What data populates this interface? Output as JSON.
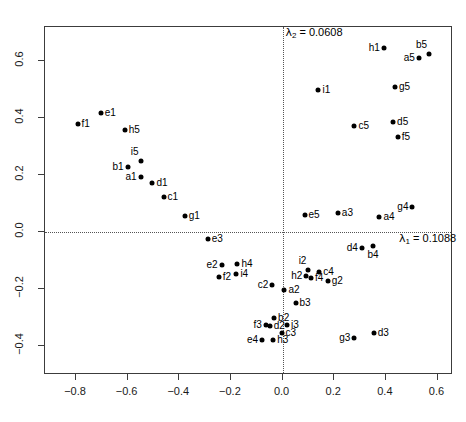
{
  "chart_data": {
    "type": "scatter",
    "title": "",
    "xlabel": "",
    "ylabel": "",
    "xlim": [
      -0.92,
      0.66
    ],
    "ylim": [
      -0.5,
      0.72
    ],
    "xticks": [
      "-0.8",
      "-0.6",
      "-0.4",
      "-0.2",
      "0.0",
      "0.2",
      "0.4",
      "0.6"
    ],
    "xtick_values": [
      -0.8,
      -0.6,
      -0.4,
      -0.2,
      0.0,
      0.2,
      0.4,
      0.6
    ],
    "yticks": [
      "0.6",
      "0.4",
      "0.2",
      "0.0",
      "-0.2",
      "-0.4"
    ],
    "ytick_values": [
      0.6,
      0.4,
      0.2,
      0.0,
      -0.2,
      -0.4
    ],
    "grid": false,
    "legend": null,
    "reference_lines": [
      {
        "orientation": "horizontal",
        "value": 0.0,
        "style": "dotted"
      },
      {
        "orientation": "vertical",
        "value": 0.0,
        "style": "dotted"
      }
    ],
    "annotations": [
      {
        "name": "lambda2-annotation",
        "text_lambda": "λ",
        "text_sub": "2",
        "text_rest": "= 0.0608",
        "x": 0.015,
        "y": 0.695,
        "align": "left"
      },
      {
        "name": "lambda1-annotation",
        "text_lambda": "λ",
        "text_sub": "1",
        "text_rest": "= 0.1088",
        "x": 0.455,
        "y": -0.026,
        "align": "left"
      }
    ],
    "points": [
      {
        "label": "f1",
        "x": -0.79,
        "y": 0.375,
        "lpos": "right"
      },
      {
        "label": "e1",
        "x": -0.7,
        "y": 0.414,
        "lpos": "right"
      },
      {
        "label": "h5",
        "x": -0.607,
        "y": 0.357,
        "lpos": "right"
      },
      {
        "label": "i5",
        "x": -0.546,
        "y": 0.246,
        "lpos": "left-up"
      },
      {
        "label": "b1",
        "x": -0.596,
        "y": 0.225,
        "lpos": "left"
      },
      {
        "label": "a1",
        "x": -0.546,
        "y": 0.189,
        "lpos": "left"
      },
      {
        "label": "d1",
        "x": -0.5,
        "y": 0.171,
        "lpos": "right"
      },
      {
        "label": "c1",
        "x": -0.457,
        "y": 0.121,
        "lpos": "right"
      },
      {
        "label": "g1",
        "x": -0.375,
        "y": 0.054,
        "lpos": "right"
      },
      {
        "label": "e3",
        "x": -0.286,
        "y": -0.027,
        "lpos": "right"
      },
      {
        "label": "e2",
        "x": -0.232,
        "y": -0.118,
        "lpos": "left"
      },
      {
        "label": "f2",
        "x": -0.243,
        "y": -0.161,
        "lpos": "right"
      },
      {
        "label": "h4",
        "x": -0.171,
        "y": -0.114,
        "lpos": "right"
      },
      {
        "label": "i4",
        "x": -0.175,
        "y": -0.15,
        "lpos": "right"
      },
      {
        "label": "c2",
        "x": -0.036,
        "y": -0.189,
        "lpos": "left"
      },
      {
        "label": "a2",
        "x": 0.011,
        "y": -0.207,
        "lpos": "right"
      },
      {
        "label": "h2",
        "x": 0.096,
        "y": -0.155,
        "lpos": "left"
      },
      {
        "label": "i2",
        "x": 0.104,
        "y": -0.136,
        "lpos": "left-up"
      },
      {
        "label": "f4",
        "x": 0.114,
        "y": -0.164,
        "lpos": "right"
      },
      {
        "label": "c4",
        "x": 0.146,
        "y": -0.143,
        "lpos": "right"
      },
      {
        "label": "g2",
        "x": 0.179,
        "y": -0.175,
        "lpos": "right"
      },
      {
        "label": "d4",
        "x": 0.311,
        "y": -0.057,
        "lpos": "left"
      },
      {
        "label": "b4",
        "x": 0.354,
        "y": -0.05,
        "lpos": "below"
      },
      {
        "label": "b3",
        "x": 0.054,
        "y": -0.25,
        "lpos": "right"
      },
      {
        "label": "b2",
        "x": -0.029,
        "y": -0.304,
        "lpos": "right"
      },
      {
        "label": "f3",
        "x": -0.061,
        "y": -0.329,
        "lpos": "left"
      },
      {
        "label": "d2",
        "x": -0.046,
        "y": -0.332,
        "lpos": "right"
      },
      {
        "label": "i3",
        "x": 0.021,
        "y": -0.329,
        "lpos": "right"
      },
      {
        "label": "c3",
        "x": 0.0,
        "y": -0.357,
        "lpos": "right"
      },
      {
        "label": "e4",
        "x": -0.075,
        "y": -0.382,
        "lpos": "left"
      },
      {
        "label": "h3",
        "x": -0.032,
        "y": -0.382,
        "lpos": "right"
      },
      {
        "label": "g3",
        "x": 0.282,
        "y": -0.375,
        "lpos": "left"
      },
      {
        "label": "d3",
        "x": 0.357,
        "y": -0.357,
        "lpos": "right"
      },
      {
        "label": "e5",
        "x": 0.089,
        "y": 0.057,
        "lpos": "right"
      },
      {
        "label": "a3",
        "x": 0.218,
        "y": 0.064,
        "lpos": "right"
      },
      {
        "label": "a4",
        "x": 0.379,
        "y": 0.05,
        "lpos": "right"
      },
      {
        "label": "i1",
        "x": 0.143,
        "y": 0.496,
        "lpos": "right"
      },
      {
        "label": "c5",
        "x": 0.282,
        "y": 0.371,
        "lpos": "right"
      },
      {
        "label": "h1",
        "x": 0.396,
        "y": 0.643,
        "lpos": "left"
      },
      {
        "label": "b5",
        "x": 0.571,
        "y": 0.621,
        "lpos": "left-up"
      },
      {
        "label": "a5",
        "x": 0.532,
        "y": 0.607,
        "lpos": "left"
      },
      {
        "label": "g5",
        "x": 0.439,
        "y": 0.507,
        "lpos": "right"
      },
      {
        "label": "d5",
        "x": 0.432,
        "y": 0.382,
        "lpos": "right"
      },
      {
        "label": "f5",
        "x": 0.45,
        "y": 0.332,
        "lpos": "right"
      },
      {
        "label": "g4",
        "x": 0.507,
        "y": 0.086,
        "lpos": "left"
      }
    ],
    "colors": {
      "point": "#000000",
      "axis": "#3c3c3c",
      "reference_line": "#555555",
      "text": "#000000",
      "background": "#ffffff"
    }
  }
}
